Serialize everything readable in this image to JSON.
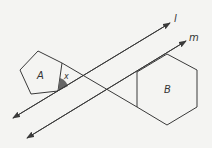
{
  "diagram": {
    "labels": {
      "shape_a": "A",
      "shape_b": "B",
      "angle": "x",
      "line_l": "l",
      "line_m": "m"
    },
    "colors": {
      "background": "#f4f4f2",
      "stroke": "#3a3a3a",
      "angle_fill": "#666666"
    }
  }
}
